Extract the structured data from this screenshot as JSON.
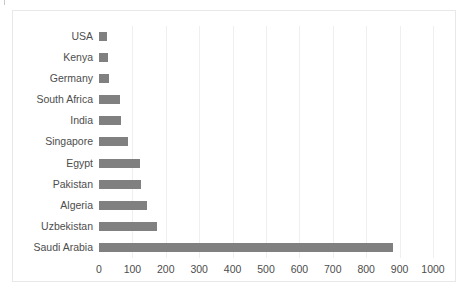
{
  "chart_data": {
    "type": "bar",
    "orientation": "horizontal",
    "title": "",
    "subtitle": "",
    "xlabel": "",
    "ylabel": "",
    "categories": [
      "USA",
      "Kenya",
      "Germany",
      "South Africa",
      "India",
      "Singapore",
      "Egypt",
      "Pakistan",
      "Algeria",
      "Uzbekistan",
      "Saudi Arabia"
    ],
    "values": [
      25,
      28,
      30,
      62,
      66,
      86,
      123,
      126,
      144,
      174,
      880
    ],
    "series": [
      {
        "name": "",
        "values": [
          25,
          28,
          30,
          62,
          66,
          86,
          123,
          126,
          144,
          174,
          880
        ]
      }
    ],
    "xlim": [
      0,
      1000
    ],
    "xticks": [
      0,
      100,
      200,
      300,
      400,
      500,
      600,
      700,
      800,
      900,
      1000
    ],
    "xtick_labels": [
      "0",
      "100",
      "200",
      "300",
      "400",
      "500",
      "600",
      "700",
      "800",
      "900",
      "1000"
    ],
    "grid": {
      "vertical": true,
      "horizontal": false,
      "color": "#efefef"
    },
    "legend": {
      "visible": false,
      "position": "none",
      "entries": []
    },
    "bar_color": "#808080",
    "text_color": "#4d4d4d",
    "background_color": "#ffffff",
    "frame_color": "#e8e8e8"
  }
}
